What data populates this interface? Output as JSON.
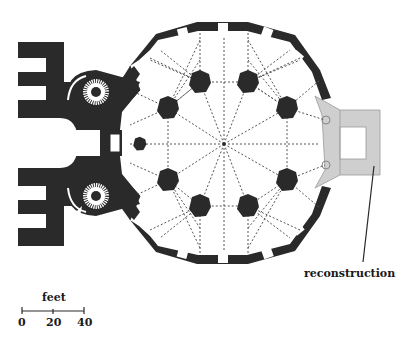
{
  "diagram": {
    "type": "architectural floor plan",
    "colors": {
      "wall": "#2a2a2a",
      "reconstruction": "#cfcfcf",
      "dashed_lines": "#555555",
      "background": "#ffffff"
    },
    "labels": {
      "reconstruction": "reconstruction"
    },
    "scale_bar": {
      "unit": "feet",
      "ticks": [
        "0",
        "20",
        "40"
      ]
    }
  }
}
